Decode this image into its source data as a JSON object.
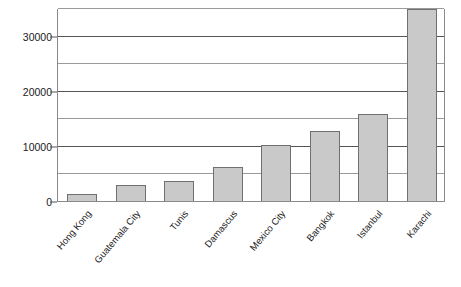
{
  "chart_data": {
    "type": "bar",
    "title": "",
    "subtitle": "",
    "xlabel": "",
    "ylabel": "",
    "categories": [
      "Hong Kong",
      "Guatemala City",
      "Tunis",
      "Damascus",
      "Mexico City",
      "Bangkok",
      "Istanbul",
      "Karachi"
    ],
    "values": [
      1400,
      3100,
      3800,
      6300,
      10400,
      12800,
      16000,
      35000
    ],
    "ylim": [
      0,
      35000
    ],
    "yticks": [
      0,
      10000,
      20000,
      30000
    ],
    "ytick_labels": [
      "0",
      "10000",
      "20000",
      "30000"
    ],
    "minor_gridlines": [
      5000,
      15000,
      25000,
      35000
    ],
    "grid": true,
    "legend": "none",
    "bar_color": "#c9c9c9",
    "bar_border_color": "#6f6f6f",
    "gridline_color": "#555555",
    "axis_color": "#8a8a8a",
    "text_color": "#1a1a1a",
    "background": "#ffffff",
    "xlabel_rotation": -50
  }
}
